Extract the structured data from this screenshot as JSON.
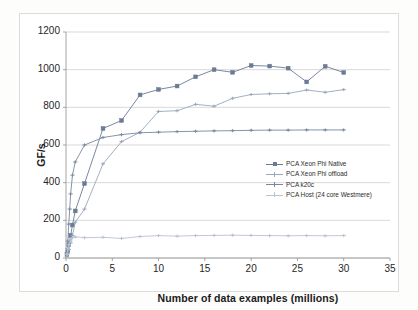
{
  "chart_data": {
    "type": "line",
    "title": "",
    "xlabel": "Number of data examples (millions)",
    "ylabel": "GF/s",
    "xlim": [
      0,
      35
    ],
    "ylim": [
      0,
      1200
    ],
    "xticks": [
      0,
      5,
      10,
      15,
      20,
      25,
      30,
      35
    ],
    "yticks": [
      0,
      200,
      400,
      600,
      800,
      1000,
      1200
    ],
    "xtick_labels": [
      "0",
      "5",
      "10",
      "15",
      "20",
      "25",
      "30",
      "35"
    ],
    "ytick_labels": [
      "0",
      "200",
      "400",
      "600",
      "800",
      "1000",
      "1200"
    ],
    "grid": "horizontal",
    "legend_position": "center-right-inside",
    "series": [
      {
        "name": "PCA Xeon Phi Native",
        "color": "#6b7b94",
        "marker": "square",
        "x": [
          0.1,
          0.2,
          0.3,
          0.5,
          0.7,
          1.0,
          2.0,
          4.0,
          6.0,
          8.0,
          10.0,
          12.0,
          14.0,
          16.0,
          18.0,
          20.0,
          22.0,
          24.0,
          26.0,
          28.0,
          30.0
        ],
        "y": [
          18,
          40,
          70,
          120,
          175,
          250,
          395,
          688,
          730,
          866,
          895,
          913,
          962,
          1000,
          986,
          1022,
          1019,
          1008,
          935,
          1018,
          985
        ]
      },
      {
        "name": "PCA Xeon Phi offload",
        "color": "#9aa7bb",
        "marker": "cross",
        "x": [
          0.1,
          0.2,
          0.3,
          0.5,
          0.7,
          1.0,
          2.0,
          4.0,
          6.0,
          8.0,
          10.0,
          12.0,
          14.0,
          16.0,
          18.0,
          20.0,
          22.0,
          24.0,
          26.0,
          28.0,
          30.0
        ],
        "y": [
          10,
          25,
          45,
          80,
          120,
          190,
          260,
          500,
          618,
          668,
          778,
          782,
          816,
          806,
          848,
          868,
          872,
          874,
          892,
          880,
          894
        ]
      },
      {
        "name": "PCA k20c",
        "color": "#78889e",
        "marker": "cross",
        "x": [
          0.1,
          0.2,
          0.3,
          0.4,
          0.5,
          0.7,
          1.0,
          2.0,
          4.0,
          6.0,
          8.0,
          10.0,
          12.0,
          14.0,
          16.0,
          18.0,
          20.0,
          22.0,
          24.0,
          26.0,
          28.0,
          30.0
        ],
        "y": [
          30,
          90,
          180,
          260,
          340,
          440,
          510,
          600,
          640,
          655,
          665,
          668,
          671,
          673,
          675,
          676,
          678,
          679,
          679,
          680,
          680,
          680
        ]
      },
      {
        "name": "PCA Host (24 core Westmere)",
        "color": "#bac3d0",
        "marker": "cross",
        "x": [
          0.1,
          0.2,
          0.3,
          0.5,
          0.7,
          1.0,
          2.0,
          4.0,
          6.0,
          8.0,
          10.0,
          12.0,
          14.0,
          16.0,
          18.0,
          20.0,
          22.0,
          24.0,
          26.0,
          28.0,
          30.0
        ],
        "y": [
          20,
          48,
          70,
          95,
          108,
          112,
          108,
          110,
          104,
          114,
          119,
          116,
          119,
          120,
          121,
          120,
          119,
          118,
          119,
          118,
          119
        ]
      }
    ]
  },
  "axes": {
    "x_title": "Number of data examples (millions)",
    "y_title": "GF/s"
  },
  "legend": {
    "entries": [
      {
        "label": "PCA Xeon Phi Native"
      },
      {
        "label": "PCA Xeon Phi offload"
      },
      {
        "label": "PCA k20c"
      },
      {
        "label": "PCA Host (24 core Westmere)"
      }
    ]
  },
  "colors": {
    "native": "#6b7b94",
    "offload": "#9aa7bb",
    "k20c": "#78889e",
    "host": "#bac3d0",
    "grid": "#c8c8c8",
    "axis": "#9a9a9a",
    "frame": "#dcdcdc"
  }
}
